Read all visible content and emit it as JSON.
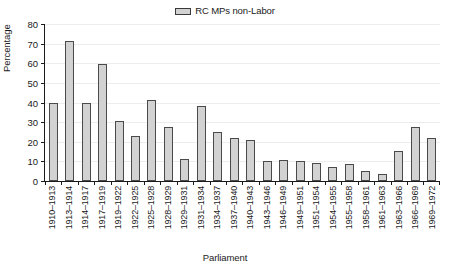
{
  "chart_data": {
    "type": "bar",
    "title": "",
    "xlabel": "Parliament",
    "ylabel": "Percentage",
    "ylim": [
      0,
      80
    ],
    "ytick_step": 10,
    "yticks": [
      80,
      70,
      60,
      50,
      40,
      30,
      20,
      10,
      0
    ],
    "grid": true,
    "legend_position": "top-center",
    "legend": [
      "RC MPs non-Labor"
    ],
    "series": [
      {
        "name": "RC MPs non-Labor",
        "color": "#d2d2d2",
        "border_color": "#4a4a4a",
        "values": [
          39.5,
          71.3,
          39.6,
          59.5,
          30.8,
          22.9,
          41.5,
          27.5,
          11.0,
          38.0,
          25.2,
          21.8,
          20.7,
          10.0,
          10.5,
          10.4,
          9.4,
          7.0,
          8.6,
          4.9,
          3.4,
          15.5,
          27.4,
          22.0
        ]
      }
    ],
    "categories": [
      "1910–1913",
      "1913–1914",
      "1914–1917",
      "1917–1919",
      "1919–1922",
      "1922–1925",
      "1925–1928",
      "1928–1929",
      "1929–1931",
      "1931–1934",
      "1934–1937",
      "1937–1940",
      "1940–1943",
      "1943–1946",
      "1946–1949",
      "1949–1951",
      "1951–1954",
      "1954–1955",
      "1955–1958",
      "1958–1961",
      "1961–1963",
      "1963–1966",
      "1966–1969",
      "1969–1972"
    ]
  },
  "legend": {
    "label": "RC MPs non-Labor"
  },
  "axes": {
    "y_title": "Percentage",
    "x_title": "Parliament"
  }
}
